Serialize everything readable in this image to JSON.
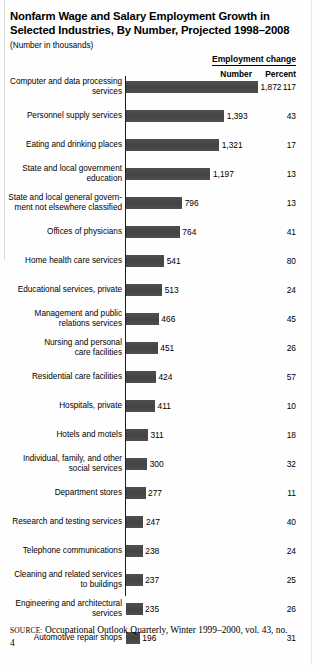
{
  "header": {
    "title": "Nonfarm Wage and Salary Employment Growth in Selected Industries, By Number, Projected 1998–2008",
    "subtitle": "(Number in thousands)"
  },
  "columns": {
    "group_label": "Employment  change",
    "number_label": "Number",
    "percent_label": "Percent"
  },
  "source": {
    "kicker": "SOURCE:",
    "text": " Occupational Outlook Quarterly, Winter 1999–2000, vol. 43, no. 4"
  },
  "chart_data": {
    "type": "bar",
    "orientation": "horizontal",
    "title": "Nonfarm Wage and Salary Employment Growth in Selected Industries, By Number, Projected 1998–2008",
    "subtitle": "(Number in thousands)",
    "xlabel": "",
    "ylabel": "",
    "xlim": [
      0,
      1872
    ],
    "grid": false,
    "legend": null,
    "value_unit": "thousands",
    "bar_color": "#4a4a4a",
    "categories": [
      "Computer and data processing\nservices",
      "Personnel supply services",
      "Eating and drinking places",
      "State and local government\neducation",
      "State and local general govern-\nment not elsewhere classified",
      "Offices of physicians",
      "Home health care services",
      "Educational services, private",
      "Management and public\nrelations services",
      "Nursing and personal\ncare facilities",
      "Residential care facilities",
      "Hospitals, private",
      "Hotels and motels",
      "Individual, family, and other\nsocial services",
      "Department stores",
      "Research and testing services",
      "Telephone communications",
      "Cleaning and related services\nto buildings",
      "Engineering and architectural\nservices",
      "Automotive repair shops"
    ],
    "values": [
      1872,
      1393,
      1321,
      1197,
      796,
      764,
      541,
      513,
      466,
      451,
      424,
      411,
      311,
      300,
      277,
      247,
      238,
      237,
      235,
      196
    ],
    "value_labels": [
      "1,872",
      "1,393",
      "1,321",
      "1,197",
      "796",
      "764",
      "541",
      "513",
      "466",
      "451",
      "424",
      "411",
      "311",
      "300",
      "277",
      "247",
      "238",
      "237",
      "235",
      "196"
    ],
    "percent": [
      117,
      43,
      17,
      13,
      13,
      41,
      80,
      24,
      45,
      26,
      57,
      10,
      18,
      32,
      11,
      40,
      24,
      25,
      26,
      31
    ],
    "percent_labels": [
      "117",
      "43",
      "17",
      "13",
      "13",
      "41",
      "80",
      "24",
      "45",
      "26",
      "57",
      "10",
      "18",
      "32",
      "11",
      "40",
      "24",
      "25",
      "26",
      "31"
    ]
  }
}
